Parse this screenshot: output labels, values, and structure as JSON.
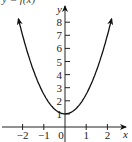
{
  "chart_data": {
    "type": "line",
    "title": "y = f(x)",
    "xlabel": "x",
    "ylabel": "y",
    "xlim": [
      -2.8,
      2.8
    ],
    "ylim": [
      -0.5,
      9.3
    ],
    "x_ticks": [
      -2,
      -1,
      0,
      1,
      2
    ],
    "x_tick_labels": [
      "−2",
      "−1",
      "0",
      "1",
      "2"
    ],
    "y_ticks": [
      1,
      2,
      3,
      4,
      5,
      6,
      7,
      8
    ],
    "y_tick_labels": [
      "1",
      "2",
      "3",
      "4",
      "5",
      "6",
      "7",
      "8"
    ],
    "grid": false,
    "legend": null,
    "series": [
      {
        "name": "f(x)",
        "x": [
          -2.2,
          -2,
          -1.8,
          -1.5,
          -1,
          -0.5,
          0,
          0.5,
          1,
          1.5,
          1.8,
          2,
          2.2
        ],
        "values": [
          8.3,
          7.0,
          5.9,
          4.4,
          2.5,
          1.4,
          1.0,
          1.4,
          2.5,
          4.4,
          5.9,
          7.0,
          8.3
        ]
      }
    ],
    "annotations": [
      "arrowheads at both curve ends",
      "min point at (0, 1)"
    ]
  },
  "colors": {
    "axis": "#222222",
    "curve": "#111111"
  }
}
